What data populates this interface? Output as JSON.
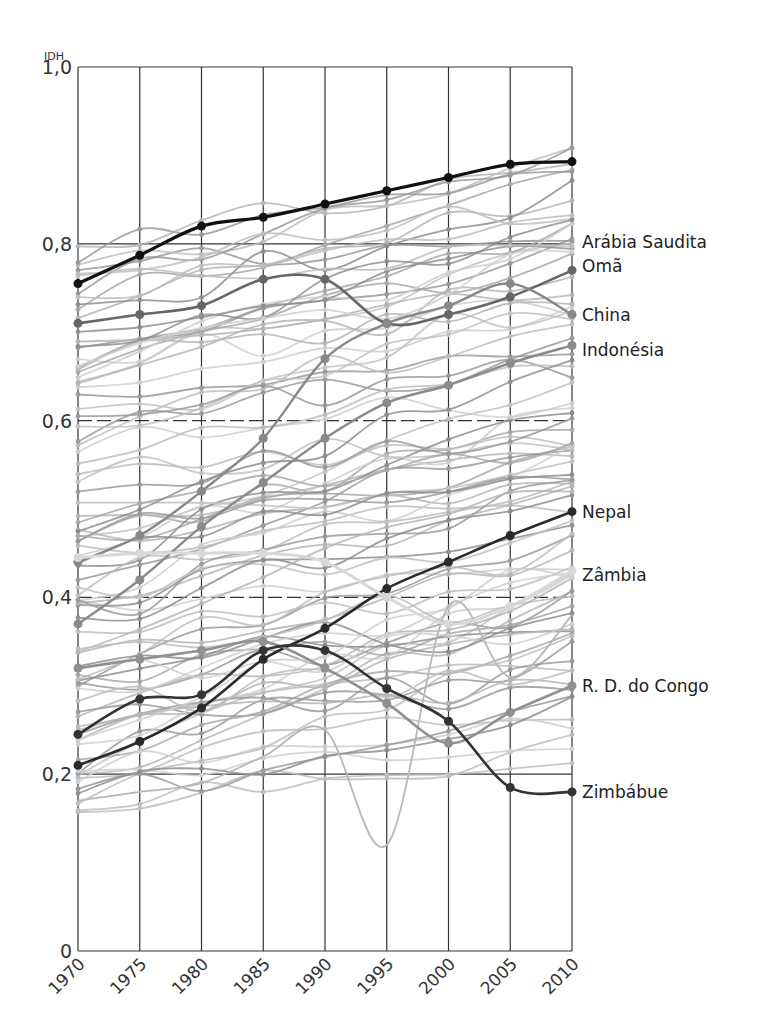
{
  "chart_data": {
    "type": "line",
    "title": "",
    "xlabel": "",
    "ylabel": "IDH",
    "ylim": [
      0,
      1.0
    ],
    "xlim": [
      1970,
      2010
    ],
    "grid": true,
    "legend_position": "right-end labels",
    "x": [
      1970,
      1975,
      1980,
      1985,
      1990,
      1995,
      2000,
      2005,
      2010
    ],
    "x_tick_labels": [
      "1970",
      "1975",
      "1980",
      "1985",
      "1990",
      "1995",
      "2000",
      "2005",
      "2010"
    ],
    "y_ticks": [
      0,
      0.2,
      0.4,
      0.6,
      0.8,
      1.0
    ],
    "y_tick_labels": [
      "0",
      "0,2",
      "0,4",
      "0,6",
      "0,8",
      "1,0"
    ],
    "series": [
      {
        "name": "Arábia Saudita",
        "label_y": 0.795,
        "values": [
          0.755,
          0.787,
          0.82,
          0.83,
          0.845,
          0.86,
          0.875,
          0.89,
          0.893
        ],
        "color": "#111111",
        "width": 3.2,
        "labeled": false
      },
      {
        "name": "Omã",
        "values": [
          0.71,
          0.72,
          0.73,
          0.76,
          0.76,
          0.71,
          0.72,
          0.74,
          0.77
        ],
        "color": "#666666",
        "width": 2.6
      },
      {
        "name": "China",
        "values": [
          0.44,
          0.47,
          0.52,
          0.58,
          0.67,
          0.71,
          0.73,
          0.755,
          0.72
        ],
        "color": "#888888",
        "width": 2.4
      },
      {
        "name": "Indonésia",
        "values": [
          0.37,
          0.42,
          0.48,
          0.53,
          0.58,
          0.62,
          0.64,
          0.665,
          0.685
        ],
        "color": "#8a8a8a",
        "width": 2.4
      },
      {
        "name": "Nepal",
        "values": [
          0.21,
          0.237,
          0.275,
          0.33,
          0.365,
          0.41,
          0.44,
          0.47,
          0.497
        ],
        "color": "#2a2a2a",
        "width": 2.6
      },
      {
        "name": "Zâmbia",
        "values": [
          0.445,
          0.45,
          0.45,
          0.45,
          0.44,
          0.4,
          0.37,
          0.39,
          0.43
        ],
        "color": "#d8d8d8",
        "width": 3.0
      },
      {
        "name": "R. D. do Congo",
        "values": [
          0.32,
          0.33,
          0.34,
          0.35,
          0.32,
          0.28,
          0.235,
          0.27,
          0.3
        ],
        "color": "#909090",
        "width": 2.6
      },
      {
        "name": "Zimbábue",
        "values": [
          0.245,
          0.285,
          0.29,
          0.34,
          0.34,
          0.297,
          0.26,
          0.185,
          0.18
        ],
        "color": "#333333",
        "width": 2.6
      }
    ],
    "annotations": [
      {
        "text": "Arábia Saudita",
        "y": 0.802
      },
      {
        "text": "Omã",
        "y": 0.775
      },
      {
        "text": "China",
        "y": 0.72
      },
      {
        "text": "Indonésia",
        "y": 0.68
      },
      {
        "text": "Nepal",
        "y": 0.497
      },
      {
        "text": "Zâmbia",
        "y": 0.425
      },
      {
        "text": "R. D. do Congo",
        "y": 0.3
      },
      {
        "text": "Zimbábue",
        "y": 0.18
      }
    ],
    "background_series_note": "Many unlabeled countries drawn as gray lines between 0.15 and 0.94"
  }
}
